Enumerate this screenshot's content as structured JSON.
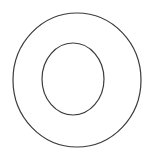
{
  "canvas": {
    "width": 149,
    "height": 158,
    "background_color": "#ffffff",
    "title": "Concentric circles (annulus) line drawing"
  },
  "diagram": {
    "type": "concentric-circles",
    "shape_count": 2,
    "stroke_color": "#3b3b3b",
    "fill_color": "none",
    "shapes": [
      {
        "name": "outer-circle",
        "role": "outer boundary",
        "cx": 77,
        "cy": 80,
        "rx": 64,
        "ry": 67,
        "stroke_color": "#3b3b3b",
        "stroke_width": 1.2,
        "fill": "none"
      },
      {
        "name": "inner-circle",
        "role": "inner boundary",
        "cx": 73,
        "cy": 79,
        "rx": 31,
        "ry": 36,
        "stroke_color": "#3b3b3b",
        "stroke_width": 1.2,
        "fill": "none"
      }
    ],
    "labels": [],
    "annotations": []
  }
}
